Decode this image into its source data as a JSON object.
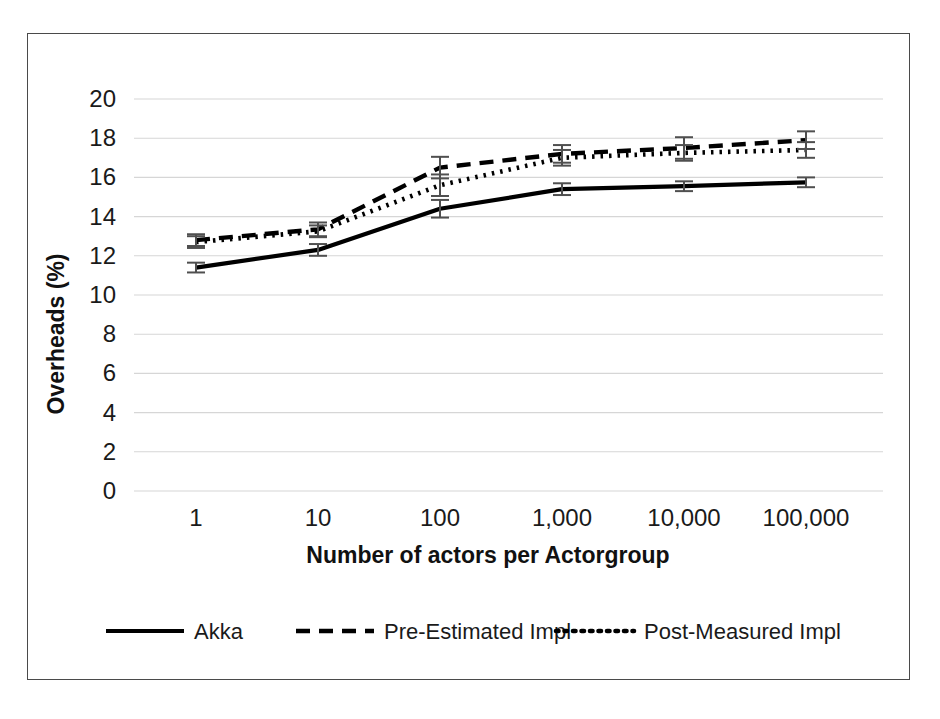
{
  "chart_data": {
    "type": "line",
    "title": "",
    "xlabel": "Number of actors per Actorgroup",
    "ylabel": "Overheads (%)",
    "categories": [
      "1",
      "10",
      "100",
      "1,000",
      "10,000",
      "100,000"
    ],
    "xtick_labels": [
      "1",
      "10",
      "100",
      "1,000",
      "10,000",
      "100,000"
    ],
    "ytick_labels": [
      "0",
      "2",
      "4",
      "6",
      "8",
      "10",
      "12",
      "14",
      "16",
      "18",
      "20"
    ],
    "ylim": [
      0,
      20
    ],
    "ytick_step": 2,
    "grid": "horizontal",
    "legend_position": "bottom",
    "series": [
      {
        "name": "Akka",
        "style": "solid",
        "values": [
          11.4,
          12.3,
          14.4,
          15.4,
          15.55,
          15.75
        ],
        "errors": [
          0.25,
          0.3,
          0.45,
          0.3,
          0.25,
          0.25
        ]
      },
      {
        "name": "Pre-Estimated Impl",
        "style": "dashed",
        "values": [
          12.8,
          13.35,
          16.5,
          17.2,
          17.5,
          17.9
        ],
        "errors": [
          0.3,
          0.35,
          0.55,
          0.45,
          0.55,
          0.45
        ]
      },
      {
        "name": "Post-Measured Impl",
        "style": "dotted",
        "values": [
          12.7,
          13.25,
          15.6,
          17.0,
          17.25,
          17.4
        ],
        "errors": [
          0.3,
          0.3,
          0.55,
          0.4,
          0.4,
          0.4
        ]
      }
    ]
  },
  "legend": {
    "items": [
      {
        "label": "Akka",
        "style": "solid"
      },
      {
        "label": "Pre-Estimated Impl",
        "style": "dashed"
      },
      {
        "label": "Post-Measured Impl",
        "style": "dotted"
      }
    ]
  },
  "axes": {
    "y_title": "Overheads (%)",
    "x_title": "Number of actors per Actorgroup"
  },
  "colors": {
    "line": "#000000",
    "grid": "#d6d6d6",
    "border": "#4a4a4a",
    "text": "#1a1a1a",
    "background": "#ffffff"
  }
}
